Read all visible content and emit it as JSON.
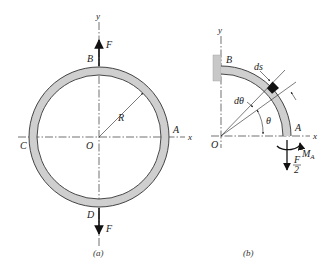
{
  "figure_a": {
    "caption": "(a)",
    "axis_y": "y",
    "axis_x": "x",
    "point_top": "B",
    "point_bottom": "D",
    "point_left": "C",
    "point_right": "A",
    "origin": "O",
    "radius_label": "R",
    "force_top": "F",
    "force_bottom": "F"
  },
  "figure_b": {
    "caption": "(b)",
    "axis_y": "y",
    "axis_x": "x",
    "point_top": "B",
    "point_right": "A",
    "origin": "O",
    "element_label": "ds",
    "dtheta_label": "dθ",
    "theta_label": "θ",
    "moment_label": "M",
    "moment_sub": "A",
    "force_num": "F",
    "force_den": "2"
  },
  "colors": {
    "ring_fill": "#cfcfcf",
    "ink": "#222222",
    "wall": "#c8c8c8",
    "element": "#111111"
  }
}
